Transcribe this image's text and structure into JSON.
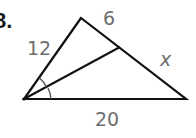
{
  "problem": {
    "number": "8."
  },
  "figure": {
    "type": "triangle-with-angle-bisector",
    "vertices": {
      "apex": [
        81,
        18
      ],
      "bottom_left": [
        24,
        99
      ],
      "bottom_right": [
        186,
        99
      ],
      "bisector_foot": [
        120,
        47
      ]
    },
    "labels": {
      "left_side": "12",
      "top_right_segment": "6",
      "bottom_right_segment": "x",
      "base": "20"
    },
    "colors": {
      "stroke": "#111111",
      "label": "#6e6e6e"
    }
  }
}
